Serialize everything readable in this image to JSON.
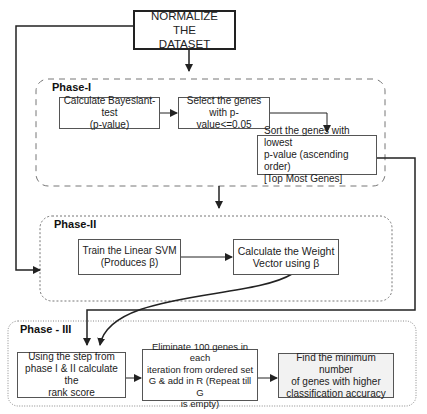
{
  "title_box": {
    "line1": "NORMALIZE THE",
    "line2": "DATASET"
  },
  "phases": [
    {
      "label": "Phase-I",
      "boxes": [
        {
          "lines": [
            "Calculate Bayesiant-test",
            "(p-value)"
          ]
        },
        {
          "lines": [
            "Select the genes",
            "with p-value<=0.05"
          ]
        },
        {
          "lines": [
            "Sort the genes with lowest",
            "p-value (ascending order)",
            "[Top Most Genes]"
          ]
        }
      ]
    },
    {
      "label": "Phase-II",
      "boxes": [
        {
          "lines": [
            "Train the Linear SVM",
            "(Produces β)"
          ]
        },
        {
          "lines": [
            "Calculate the Weight",
            "Vector using β"
          ]
        }
      ]
    },
    {
      "label": "Phase - III",
      "boxes": [
        {
          "lines": [
            "Using the step from",
            "phase I & II calculate the",
            "rank score"
          ]
        },
        {
          "lines": [
            "Eliminate 100 genes in each",
            "iteration from ordered set",
            "G & add in R (Repeat till G",
            "is empty)"
          ]
        },
        {
          "lines": [
            "Find the minimum number",
            "of genes with higher",
            "classification accuracy"
          ]
        }
      ]
    }
  ]
}
